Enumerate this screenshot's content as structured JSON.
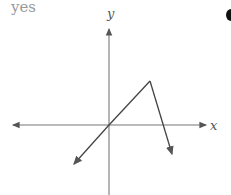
{
  "answer_label": "yes",
  "axes": {
    "x_label": "x",
    "y_label": "y"
  },
  "graph": {
    "description": "Piecewise linear graph: line through origin rising to a peak, then steeply descending; arrows on both ends",
    "points": [
      [
        73,
        165
      ],
      [
        109,
        125
      ],
      [
        150,
        81
      ],
      [
        173,
        156
      ]
    ],
    "colors": {
      "axis": "#777777",
      "curve": "#444444",
      "label": "#9a9a9a"
    }
  }
}
